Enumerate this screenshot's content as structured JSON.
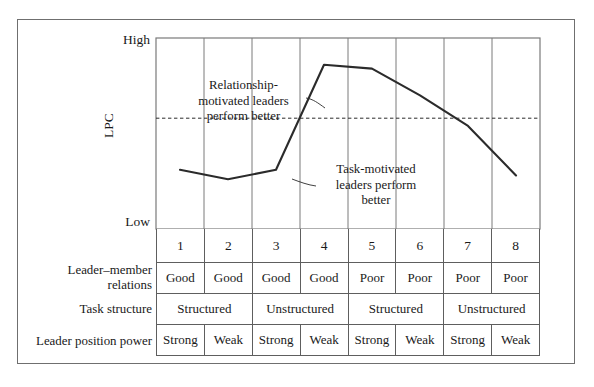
{
  "chart_data": {
    "type": "line",
    "title": "",
    "xlabel": "",
    "ylabel": "LPC",
    "ylim": [
      0,
      100
    ],
    "y_tick_labels": [
      "High",
      "Low"
    ],
    "axis_labels": {
      "y_high": "High",
      "y_low": "Low",
      "y_axis": "LPC"
    },
    "categories": [
      "1",
      "2",
      "3",
      "4",
      "5",
      "6",
      "7",
      "8"
    ],
    "x": [
      1,
      2,
      3,
      4,
      5,
      6,
      7,
      8
    ],
    "values": [
      31,
      26,
      31,
      86,
      84,
      70,
      54,
      28
    ],
    "grid": true,
    "gridlines_vertical_at": [
      2,
      3,
      4,
      5,
      6,
      7,
      8
    ],
    "reference_line": {
      "style": "dashed",
      "orientation": "horizontal",
      "value": 58,
      "label": ""
    },
    "annotations": [
      {
        "text": "Relationship-motivated leaders perform better",
        "lines": [
          "Relationship-",
          "motivated leaders",
          "perform better"
        ],
        "points_to_x": 3.7
      },
      {
        "text": "Task-motivated leaders perform better",
        "lines": [
          "Task-motivated",
          "leaders perform",
          "better"
        ],
        "points_to_x": 3.2
      }
    ],
    "legend": null,
    "series": [
      {
        "name": "LPC",
        "values": [
          31,
          26,
          31,
          86,
          84,
          70,
          54,
          28
        ]
      }
    ]
  },
  "table": {
    "row_labels": [
      "Leader–member relations",
      "Task structure",
      "Leader position power"
    ],
    "octant_numbers": [
      "1",
      "2",
      "3",
      "4",
      "5",
      "6",
      "7",
      "8"
    ],
    "rows": [
      {
        "label": "Leader–member relations",
        "cells": [
          {
            "text": "Good",
            "span": 1
          },
          {
            "text": "Good",
            "span": 1
          },
          {
            "text": "Good",
            "span": 1
          },
          {
            "text": "Good",
            "span": 1
          },
          {
            "text": "Poor",
            "span": 1
          },
          {
            "text": "Poor",
            "span": 1
          },
          {
            "text": "Poor",
            "span": 1
          },
          {
            "text": "Poor",
            "span": 1
          }
        ]
      },
      {
        "label": "Task structure",
        "cells": [
          {
            "text": "Structured",
            "span": 2
          },
          {
            "text": "Unstructured",
            "span": 2
          },
          {
            "text": "Structured",
            "span": 2
          },
          {
            "text": "Unstructured",
            "span": 2
          }
        ]
      },
      {
        "label": "Leader position power",
        "cells": [
          {
            "text": "Strong",
            "span": 1
          },
          {
            "text": "Weak",
            "span": 1
          },
          {
            "text": "Strong",
            "span": 1
          },
          {
            "text": "Weak",
            "span": 1
          },
          {
            "text": "Strong",
            "span": 1
          },
          {
            "text": "Weak",
            "span": 1
          },
          {
            "text": "Strong",
            "span": 1
          },
          {
            "text": "Weak",
            "span": 1
          }
        ]
      }
    ]
  },
  "colors": {
    "line": "#2b2b2b",
    "frame": "#6f6f6f",
    "grid": "#7a7a7a",
    "text": "#1a1a1a",
    "background": "#ffffff"
  }
}
